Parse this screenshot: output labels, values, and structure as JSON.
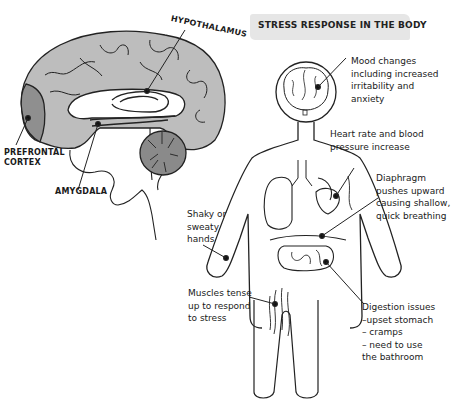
{
  "title": "STRESS RESPONSE IN THE BODY",
  "brain": {
    "labels": {
      "hypothalamus": "HYPOTHALAMUS",
      "prefrontal_cortex": "PREFRONTAL\nCORTEX",
      "amygdala": "AMYGDALA"
    },
    "colors": {
      "cortex": "#bdbdbd",
      "prefrontal": "#8f8f8f",
      "cerebellum": "#8a8a8a",
      "outline": "#222222"
    }
  },
  "body": {
    "annotations": [
      {
        "id": "mood",
        "text": "Mood changes\nincluding increased\nirritability and\nanxiety"
      },
      {
        "id": "heart",
        "text": "Heart rate and blood\npressure increase"
      },
      {
        "id": "diaphragm",
        "text": "Diaphragm\npushes upward\ncausing shallow,\nquick breathing"
      },
      {
        "id": "hands",
        "text": "Shaky or\nsweaty\nhands"
      },
      {
        "id": "muscles",
        "text": "Muscles tense\nup to respond\nto stress"
      },
      {
        "id": "digestion",
        "text": "Digestion issues\n–upset stomach\n– cramps\n– need to use\n   the bathroom"
      }
    ]
  }
}
